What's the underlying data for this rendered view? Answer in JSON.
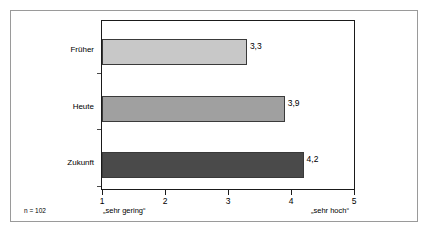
{
  "chart_data": {
    "type": "bar",
    "orientation": "horizontal",
    "title": "",
    "subtitle": "",
    "xlabel": "",
    "ylabel": "",
    "categories": [
      "Früher",
      "Heute",
      "Zukunft"
    ],
    "values": [
      3.3,
      3.9,
      4.2
    ],
    "value_labels": [
      "3,3",
      "3,9",
      "4,2"
    ],
    "xlim": [
      1,
      5
    ],
    "xticks": [
      1,
      2,
      3,
      4,
      5
    ],
    "xtick_labels": [
      "1",
      "2",
      "3",
      "4",
      "5"
    ],
    "grid": false,
    "legend": "none",
    "bar_colors": [
      "#c8c8c8",
      "#a0a0a0",
      "#4a4a4a"
    ],
    "bar_edge_color": "#3a3a3a",
    "axis_color": "#1a1a1a",
    "frame_color": "#9a9a9a",
    "annotations": {
      "sample_size": "n = 102",
      "scale_low": "„sehr gering“",
      "scale_high": "„sehr hoch“"
    }
  }
}
